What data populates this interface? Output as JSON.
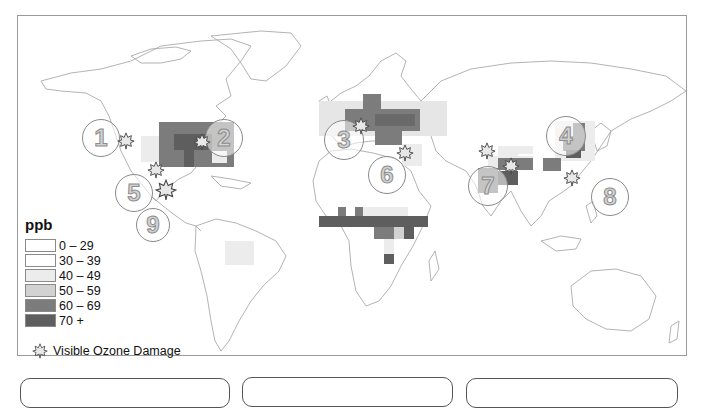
{
  "map": {
    "description": "World map of surface ozone concentrations (ppb) with visible ozone damage sites",
    "region_numbers": [
      "1",
      "2",
      "3",
      "4",
      "5",
      "6",
      "7",
      "8",
      "9"
    ]
  },
  "legend": {
    "title": "ppb",
    "items": [
      {
        "label": "0 – 29",
        "color": "#ffffff"
      },
      {
        "label": "30 – 39",
        "color": "#ffffff"
      },
      {
        "label": "40 – 49",
        "color": "#ececec"
      },
      {
        "label": "50 – 59",
        "color": "#d2d2d2"
      },
      {
        "label": "60 – 69",
        "color": "#7c7c7c"
      },
      {
        "label": "70 +",
        "color": "#5e5e5e"
      }
    ],
    "damage_label": "Visible Ozone Damage",
    "damage_icon": "maple-leaf-icon"
  },
  "colors": {
    "frame_border": "#9a9a9a",
    "coastline": "#9a9a9a",
    "circle_border": "#8a8a8a",
    "circle_number": "#d2d2d2"
  },
  "bottom_boxes": [
    "",
    "",
    ""
  ]
}
